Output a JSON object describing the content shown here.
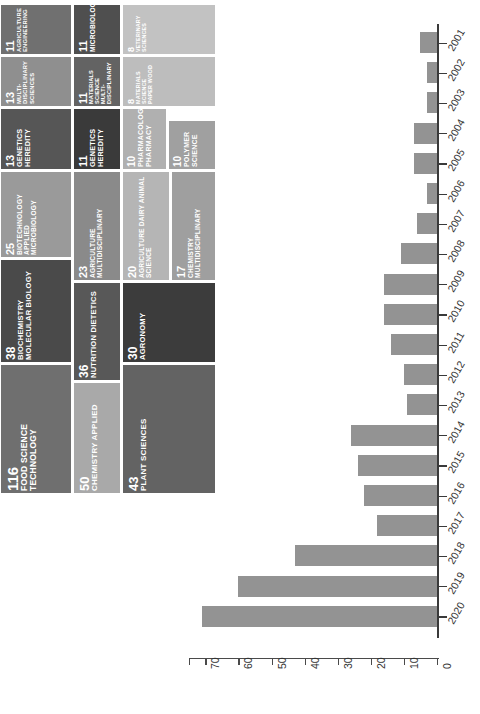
{
  "figure": {
    "orientation": "rotated-90",
    "background": "#ffffff"
  },
  "treemap": {
    "type": "treemap",
    "title": "",
    "items": [
      {
        "value": "116",
        "label": "FOOD SCIENCE TECHNOLOGY",
        "color": "#6f6f6f"
      },
      {
        "value": "50",
        "label": "CHEMISTRY APPLIED",
        "color": "#a9a9a9"
      },
      {
        "value": "43",
        "label": "PLANT SCIENCES",
        "color": "#636363"
      },
      {
        "value": "38",
        "label": "BIOCHEMISTRY MOLECULAR BIOLOGY",
        "color": "#4a4a4a"
      },
      {
        "value": "36",
        "label": "NUTRITION DIETETICS",
        "color": "#585858"
      },
      {
        "value": "30",
        "label": "AGRONOMY",
        "color": "#3c3c3c"
      },
      {
        "value": "25",
        "label": "BIOTECHNOLOGY APPLIED MICROBIOLOGY",
        "color": "#9a9a9a"
      },
      {
        "value": "23",
        "label": "AGRICULTURE MULTIDISCIPLINARY",
        "color": "#8a8a8a"
      },
      {
        "value": "20",
        "label": "AGRICULTURE DAIRY ANIMAL SCIENCE",
        "color": "#b5b5b5"
      },
      {
        "value": "17",
        "label": "CHEMISTRY MULTIDISCIPLINARY",
        "color": "#9f9f9f"
      },
      {
        "value": "13",
        "label": "GENETICS HEREDITY",
        "color": "#565656"
      },
      {
        "value": "13",
        "label": "MULTI-DISCIPLINARY SCIENCES",
        "color": "#8f8f8f"
      },
      {
        "value": "11",
        "label": "AGRICULTURE ENGINEERING",
        "color": "#707070"
      },
      {
        "value": "11",
        "label": "GENETICS HEREDITY",
        "color": "#3a3a3a"
      },
      {
        "value": "11",
        "label": "MATERIALS SCIENCE MULTI-DISCIPLINARY",
        "color": "#636363"
      },
      {
        "value": "11",
        "label": "MICROBIOLOGY",
        "color": "#4f4f4f"
      },
      {
        "value": "10",
        "label": "PHARMACOLOGY PHARMACY",
        "color": "#b0b0b0"
      },
      {
        "value": "10",
        "label": "POLYMER SCIENCE",
        "color": "#a0a0a0"
      },
      {
        "value": "8",
        "label": "MATERIALS SCIENCE PAPER WOOD",
        "color": "#bdbdbd"
      },
      {
        "value": "8",
        "label": "VETERINARY SCIENCES",
        "color": "#c2c2c2"
      }
    ]
  },
  "chart_data": {
    "type": "bar",
    "orientation": "horizontal",
    "title": "",
    "xlabel": "",
    "ylabel": "",
    "bar_color": "#939393",
    "axis_color": "#3a3a3a",
    "grid": false,
    "legend": null,
    "xlim": [
      0,
      75
    ],
    "xticks": [
      "0",
      "10",
      "20",
      "30",
      "40",
      "50",
      "60",
      "70"
    ],
    "xtick_values": [
      0,
      10,
      20,
      30,
      40,
      50,
      60,
      70
    ],
    "categories": [
      "2001",
      "2002",
      "2003",
      "2004",
      "2005",
      "2006",
      "2007",
      "2008",
      "2009",
      "2010",
      "2011",
      "2012",
      "2013",
      "2014",
      "2015",
      "2016",
      "2017",
      "2018",
      "2019",
      "2020"
    ],
    "values": [
      5,
      3,
      3,
      7,
      7,
      3,
      6,
      11,
      16,
      16,
      14,
      10,
      9,
      26,
      24,
      22,
      18,
      43,
      60,
      71
    ]
  }
}
